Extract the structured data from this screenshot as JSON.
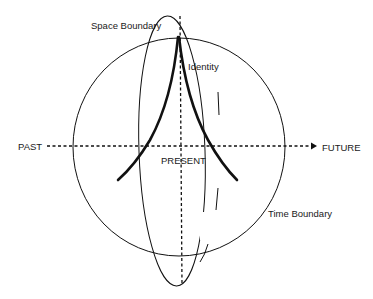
{
  "diagram": {
    "type": "conceptual-sketch",
    "labels": {
      "space_boundary": "Space Boundary",
      "identity": "Identity",
      "past": "PAST",
      "future": "FUTURE",
      "present": "PRESENT",
      "time_boundary": "Time Boundary"
    },
    "colors": {
      "stroke": "#111111",
      "background": "#ffffff"
    },
    "elements": [
      {
        "name": "time-boundary-circle",
        "shape": "circle"
      },
      {
        "name": "space-boundary-ellipse",
        "shape": "ellipse"
      },
      {
        "name": "identity-cusp",
        "shape": "thick-curves"
      },
      {
        "name": "time-axis",
        "shape": "dashed-arrow",
        "from": "PAST",
        "to": "FUTURE"
      },
      {
        "name": "present-axis",
        "shape": "dashed-vertical-line"
      }
    ]
  }
}
